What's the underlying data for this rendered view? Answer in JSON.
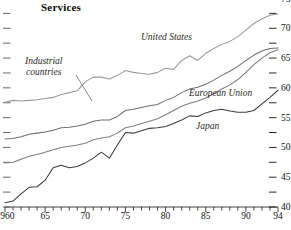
{
  "chart_data": {
    "type": "line",
    "title": "Services",
    "xlabel": "",
    "ylabel": "",
    "xlim": [
      1960,
      1994
    ],
    "ylim": [
      40,
      75
    ],
    "grid": false,
    "legend_position": "inline-annotations",
    "y_axis_side": "right",
    "y_ticks_major": [
      40,
      45,
      50,
      55,
      60,
      65,
      70,
      75
    ],
    "y_ticks_minor": [
      42.5,
      47.5,
      52.5,
      57.5,
      62.5,
      67.5,
      72.5
    ],
    "y_tick_labels": [
      "40",
      "45",
      "50",
      "55",
      "60",
      "65",
      "70",
      "75"
    ],
    "x_ticks_major": [
      1960,
      1965,
      1970,
      1975,
      1980,
      1985,
      1990,
      1994
    ],
    "x_tick_labels": [
      "1960",
      "65",
      "70",
      "75",
      "80",
      "85",
      "90",
      "94"
    ],
    "x_ticks_minor_step": 1,
    "x": [
      1960,
      1961,
      1962,
      1963,
      1964,
      1965,
      1966,
      1967,
      1968,
      1969,
      1970,
      1971,
      1972,
      1973,
      1974,
      1975,
      1976,
      1977,
      1978,
      1979,
      1980,
      1981,
      1982,
      1983,
      1984,
      1985,
      1986,
      1987,
      1988,
      1989,
      1990,
      1991,
      1992,
      1993,
      1994
    ],
    "series": [
      {
        "name": "United States",
        "color": "#9a9a9a",
        "values": [
          57.6,
          57.9,
          57.8,
          57.9,
          58.0,
          58.2,
          58.4,
          58.9,
          59.2,
          59.5,
          61.0,
          61.8,
          61.8,
          61.5,
          62.1,
          62.9,
          62.6,
          62.4,
          62.3,
          62.6,
          63.3,
          63.1,
          64.6,
          65.4,
          64.6,
          65.8,
          66.6,
          67.3,
          67.8,
          68.6,
          69.7,
          70.8,
          71.6,
          72.2,
          72.4
        ]
      },
      {
        "name": "Industrial countries",
        "color": "#6f6f6f",
        "values": [
          51.4,
          51.5,
          51.8,
          52.2,
          52.4,
          52.6,
          52.9,
          53.3,
          53.4,
          53.6,
          53.9,
          54.4,
          54.6,
          54.6,
          55.2,
          56.2,
          56.4,
          56.7,
          57.0,
          57.2,
          57.9,
          58.4,
          59.2,
          59.8,
          60.1,
          60.6,
          61.3,
          62.1,
          62.8,
          63.6,
          64.6,
          65.5,
          66.2,
          66.6,
          66.7
        ]
      },
      {
        "name": "European Union",
        "color": "#7d7d7d",
        "values": [
          47.4,
          47.5,
          48.0,
          48.5,
          48.8,
          49.2,
          49.6,
          50.0,
          50.2,
          50.4,
          50.7,
          51.3,
          51.6,
          51.8,
          52.4,
          53.3,
          53.6,
          54.0,
          54.4,
          54.8,
          55.5,
          56.2,
          56.9,
          57.4,
          57.8,
          58.3,
          59.0,
          59.8,
          60.5,
          61.4,
          62.6,
          63.9,
          65.0,
          65.9,
          66.4
        ]
      },
      {
        "name": "Japan",
        "color": "#3c3c3c",
        "values": [
          40.7,
          41.0,
          42.2,
          43.3,
          43.4,
          44.5,
          46.6,
          47.0,
          46.6,
          46.8,
          47.4,
          48.2,
          49.2,
          48.2,
          50.4,
          52.5,
          52.4,
          52.8,
          53.2,
          53.3,
          53.5,
          54.0,
          54.6,
          55.3,
          55.2,
          55.8,
          56.2,
          56.4,
          56.1,
          55.9,
          55.9,
          56.2,
          57.3,
          58.4,
          59.6
        ]
      }
    ],
    "annotations": [
      {
        "text": "Industrial countries",
        "series": "Industrial countries",
        "style": "italic-with-leader"
      },
      {
        "text": "United States",
        "series": "United States",
        "style": "italic"
      },
      {
        "text": "European Union",
        "series": "European Union",
        "style": "italic"
      },
      {
        "text": "Japan",
        "series": "Japan",
        "style": "italic"
      }
    ]
  },
  "chart": {
    "title": "Services",
    "labels": {
      "industrial_line1": "Industrial",
      "industrial_line2": "countries",
      "united_states": "United States",
      "european_union": "European Union",
      "japan": "Japan"
    },
    "y_labels": [
      "75",
      "70",
      "65",
      "60",
      "55",
      "50",
      "45",
      "40"
    ],
    "x_labels": [
      "1960",
      "65",
      "70",
      "75",
      "80",
      "85",
      "90",
      "94"
    ]
  }
}
